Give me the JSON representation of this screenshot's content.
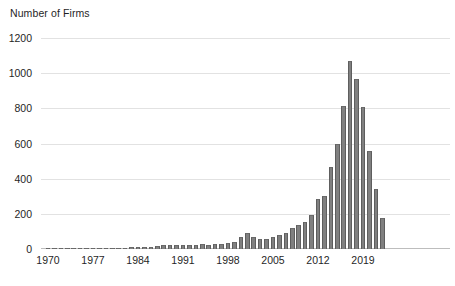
{
  "chart_data": {
    "type": "bar",
    "title": "Number of Firms",
    "xlabel": "",
    "ylabel": "Number of Firms",
    "ylim": [
      0,
      1200
    ],
    "ytick_labels": [
      "0",
      "200",
      "400",
      "600",
      "800",
      "1000",
      "1200"
    ],
    "ytick_values": [
      0,
      200,
      400,
      600,
      800,
      1000,
      1200
    ],
    "xtick_labels": [
      "1970",
      "1977",
      "1984",
      "1991",
      "1998",
      "2005",
      "2012",
      "2019"
    ],
    "xtick_values": [
      1970,
      1977,
      1984,
      1991,
      1998,
      2005,
      2012,
      2019
    ],
    "grid": true,
    "legend": "none",
    "bar_color": "#808080",
    "bar_edge_color": "#5e5e5e",
    "gridline_color": "#e2e2e2",
    "categories": [
      1970,
      1971,
      1972,
      1973,
      1974,
      1975,
      1976,
      1977,
      1978,
      1979,
      1980,
      1981,
      1982,
      1983,
      1984,
      1985,
      1986,
      1987,
      1988,
      1989,
      1990,
      1991,
      1992,
      1993,
      1994,
      1995,
      1996,
      1997,
      1998,
      1999,
      2000,
      2001,
      2002,
      2003,
      2004,
      2005,
      2006,
      2007,
      2008,
      2009,
      2010,
      2011,
      2012,
      2013,
      2014,
      2015,
      2016,
      2017,
      2018,
      2019,
      2020,
      2021,
      2022
    ],
    "values": [
      2,
      2,
      2,
      3,
      3,
      3,
      4,
      4,
      5,
      5,
      6,
      7,
      8,
      9,
      10,
      12,
      14,
      16,
      20,
      22,
      24,
      20,
      22,
      24,
      26,
      24,
      26,
      30,
      34,
      38,
      70,
      92,
      68,
      58,
      56,
      70,
      80,
      92,
      120,
      138,
      155,
      195,
      282,
      302,
      465,
      600,
      815,
      1070,
      965,
      805,
      560,
      342,
      175
    ],
    "last_partial_value": 50
  }
}
